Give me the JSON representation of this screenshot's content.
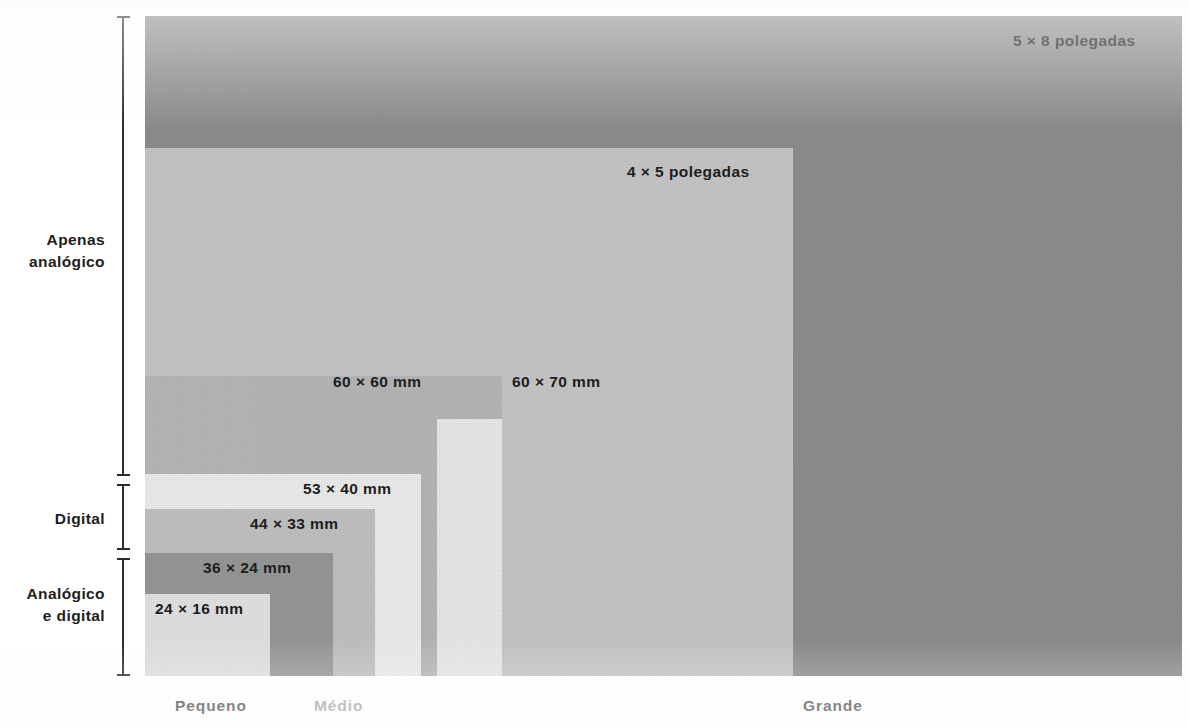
{
  "figure": {
    "top_partial_text": "",
    "background_color": "#ffffff"
  },
  "chart_data": {
    "type": "bar",
    "title": "",
    "subtitle": "",
    "xlabel": "",
    "ylabel": "",
    "legend_position": "none",
    "grid": false,
    "categories": [
      "24 × 16 mm",
      "36 × 24 mm",
      "44 × 33 mm",
      "53 × 40 mm",
      "60 × 60 mm",
      "60 × 70 mm",
      "4 × 5 polegadas",
      "5 × 8 polegadas"
    ],
    "series": [
      {
        "name": "largura (mm)",
        "values": [
          24,
          36,
          44,
          53,
          60,
          60,
          101.6,
          127
        ]
      },
      {
        "name": "altura (mm)",
        "values": [
          16,
          24,
          33,
          40,
          60,
          70,
          127,
          203.2
        ]
      }
    ],
    "size_groups": [
      "Pequeno",
      "Médio",
      "Grande"
    ],
    "technology_groups": [
      "Apenas analógico",
      "Digital",
      "Analógico e digital"
    ]
  },
  "rectangles": [
    {
      "id": "5x8",
      "label": "5 × 8 polegadas",
      "color": "#8d8d8d",
      "label_color": "#1d1d1d",
      "x": 145,
      "y": 16,
      "w": 1037,
      "h": 660,
      "label_x": 1013,
      "label_y": 32,
      "tech_group": "Apenas analógico",
      "size_group": "Grande"
    },
    {
      "id": "4x5",
      "label": "4 × 5 polegadas",
      "color": "#c6c6c6",
      "label_color": "#1d1d1d",
      "x": 145,
      "y": 148,
      "w": 648,
      "h": 528,
      "label_x": 627,
      "label_y": 163,
      "tech_group": "Apenas analógico",
      "size_group": "Grande"
    },
    {
      "id": "60x70",
      "label": "60 × 70 mm",
      "color": "#b6b6b6",
      "label_color": "#1d1d1d",
      "x": 145,
      "y": 376,
      "w": 357,
      "h": 300,
      "label_x": 512,
      "label_y": 373,
      "tech_group": "Apenas analógico",
      "size_group": "Médio"
    },
    {
      "id": "60x60",
      "label": "60 × 60 mm",
      "color": "#e9e9e9",
      "label_color": "#1d1d1d",
      "x": 437,
      "y": 419,
      "w": 65,
      "h": 257,
      "label_x": 333,
      "label_y": 373,
      "tech_group": "Apenas analógico",
      "size_group": "Médio"
    },
    {
      "id": "53x40",
      "label": "53 × 40 mm",
      "color": "#ededed",
      "label_color": "#1d1d1d",
      "x": 145,
      "y": 474,
      "w": 276,
      "h": 202,
      "label_x": 303,
      "label_y": 480,
      "tech_group": "Digital",
      "size_group": "Pequeno"
    },
    {
      "id": "44x33",
      "label": "44 × 33 mm",
      "color": "#c1c1c1",
      "label_color": "#1d1d1d",
      "x": 145,
      "y": 509,
      "w": 230,
      "h": 167,
      "label_x": 250,
      "label_y": 515,
      "tech_group": "Digital",
      "size_group": "Pequeno"
    },
    {
      "id": "36x24",
      "label": "36 × 24 mm",
      "color": "#979797",
      "label_color": "#1d1d1d",
      "x": 145,
      "y": 553,
      "w": 188,
      "h": 123,
      "label_x": 203,
      "label_y": 559,
      "tech_group": "Analógico e digital",
      "size_group": "Pequeno"
    },
    {
      "id": "24x16",
      "label": "24 × 16 mm",
      "color": "#e2e2e2",
      "label_color": "#1d1d1d",
      "x": 145,
      "y": 594,
      "w": 125,
      "h": 82,
      "label_x": 155,
      "label_y": 600,
      "tech_group": "Analógico e digital",
      "size_group": "Pequeno"
    }
  ],
  "brackets": [
    {
      "id": "apenas-analogico",
      "label": "Apenas\nanalógico",
      "x": 117,
      "y": 16,
      "h": 460,
      "label_x": 5,
      "label_y": 229,
      "label_w": 100
    },
    {
      "id": "digital",
      "label": "Digital",
      "x": 117,
      "y": 484,
      "h": 66,
      "label_x": 5,
      "label_y": 508,
      "label_w": 100
    },
    {
      "id": "analogico-e-digital",
      "label": "Analógico\ne digital",
      "x": 117,
      "y": 558,
      "h": 118,
      "label_x": 5,
      "label_y": 583,
      "label_w": 100
    }
  ],
  "axis_labels": [
    {
      "id": "pequeno",
      "text": "Pequeno",
      "x": 175,
      "y": 697,
      "color": "#3a3a3a"
    },
    {
      "id": "medio",
      "text": "Médio",
      "x": 314,
      "y": 697,
      "color": "#9d9d9d"
    },
    {
      "id": "grande",
      "text": "Grande",
      "x": 803,
      "y": 697,
      "color": "#3a3a3a"
    }
  ]
}
